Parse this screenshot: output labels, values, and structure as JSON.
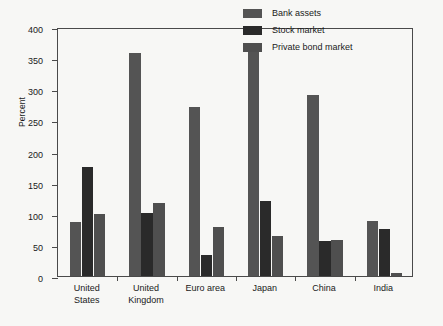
{
  "chart_data": {
    "type": "bar",
    "title": "",
    "subtitle": "",
    "xlabel": "",
    "ylabel": "Percent",
    "ylim": [
      0,
      400
    ],
    "ytick_step": 50,
    "yticks": [
      0,
      50,
      100,
      150,
      200,
      250,
      300,
      350,
      400
    ],
    "grid": false,
    "legend_position": "top-right",
    "categories": [
      "United States",
      "United Kingdom",
      "Euro area",
      "Japan",
      "China",
      "India"
    ],
    "category_labels_wrapped": [
      "United\nStates",
      "United\nKingdom",
      "Euro area",
      "Japan",
      "China",
      "India"
    ],
    "series": [
      {
        "name": "Bank assets",
        "color": "#545454",
        "values": [
          86,
          358,
          271,
          363,
          290,
          88
        ]
      },
      {
        "name": "Stock market",
        "color": "#2a2a2a",
        "values": [
          175,
          101,
          34,
          121,
          56,
          75
        ]
      },
      {
        "name": "Private bond market",
        "color": "#4f4f4f",
        "values": [
          100,
          118,
          78,
          64,
          58,
          5
        ]
      }
    ]
  },
  "axis": {
    "ytick_labels": [
      "0",
      "50",
      "100",
      "150",
      "200",
      "250",
      "300",
      "350",
      "400"
    ],
    "ylabel_text": "Percent"
  },
  "legend": {
    "items": [
      {
        "label": "Bank assets",
        "swatch": "#545454"
      },
      {
        "label": "Stock market",
        "swatch": "#2a2a2a"
      },
      {
        "label": "Private bond market",
        "swatch": "#4f4f4f"
      }
    ]
  },
  "colors": {
    "background": "#f7f7f5",
    "axis": "#4a4a4a",
    "text": "#1a1a1a",
    "bank_assets": "#545454",
    "stock_market": "#2a2a2a",
    "private_bond_market": "#4f4f4f"
  }
}
